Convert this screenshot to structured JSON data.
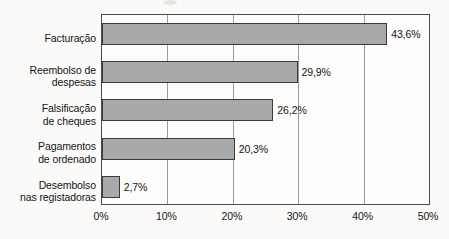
{
  "chart_data": {
    "type": "bar",
    "orientation": "horizontal",
    "title": "",
    "subtitle": "",
    "xlabel": "",
    "ylabel": "",
    "categories": [
      "Facturação",
      "Reembolso de despesas",
      "Falsificação de cheques",
      "Pagamentos de ordenado",
      "Desembolso nas registadoras"
    ],
    "category_lines": [
      [
        "Facturação"
      ],
      [
        "Reembolso de",
        "despesas"
      ],
      [
        "Falsificação",
        "de cheques"
      ],
      [
        "Pagamentos",
        "de ordenado"
      ],
      [
        "Desembolso",
        "nas registadoras"
      ]
    ],
    "values": [
      43.6,
      29.9,
      26.2,
      20.3,
      2.7
    ],
    "value_labels": [
      "43,6%",
      "29,9%",
      "26,2%",
      "20,3%",
      "2,7%"
    ],
    "xlim": [
      0,
      50
    ],
    "xticks": [
      0,
      10,
      20,
      30,
      40,
      50
    ],
    "xtick_labels": [
      "0%",
      "10%",
      "20%",
      "30%",
      "40%",
      "50%"
    ],
    "grid": true,
    "grid_axis": "x",
    "legend": false,
    "legend_position": "none",
    "bar_color": "#a9a9a9",
    "bar_border_color": "#3a3a3a",
    "plot_border_color": "#4a4a4a",
    "gridline_color": "#9a9a9a",
    "background_color": "#fbfaf8",
    "text_color": "#151515"
  }
}
